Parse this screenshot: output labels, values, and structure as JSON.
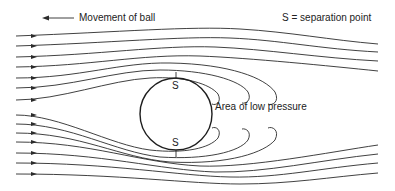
{
  "diagram": {
    "legend": {
      "movement_label": "Movement of ball",
      "movement_arrow_icon": "arrow-left-icon",
      "separation_key": "S = separation point"
    },
    "ball": {
      "top_separation_label": "S",
      "bottom_separation_label": "S"
    },
    "wake_label": "Area of low pressure",
    "streamlines": {
      "upper_count": 7,
      "lower_count": 7,
      "direction": "left-to-right",
      "wake_loops_top": 3,
      "wake_loops_bottom": 3
    },
    "colors": {
      "line": "#2b2b2b",
      "background": "#ffffff",
      "text": "#222222"
    }
  }
}
